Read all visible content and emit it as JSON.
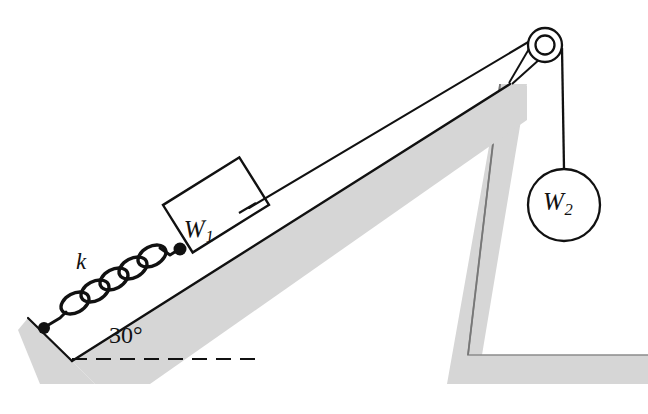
{
  "figure": {
    "type": "physics-free-body-diagram",
    "background_color": "#ffffff",
    "line_color": "#111111",
    "shadow_gray": "#d6d6d6",
    "support_gray": "#d6d6d6"
  },
  "labels": {
    "spring_constant": "k",
    "incline_angle": "30°",
    "block_weight": "W",
    "block_weight_subscript": "1",
    "hanging_weight": "W",
    "hanging_weight_subscript": "2"
  },
  "elements": {
    "incline_surface": "incline-surface",
    "incline_shadow": "incline-shadow-band",
    "left_wall": "incline-left-wall",
    "dashed_horizontal": "horizontal-reference-dashed-line",
    "spring": "coil-spring",
    "spring_coils": 5,
    "spring_anchor_lower": "spring-lower-anchor-dot",
    "spring_anchor_upper": "spring-upper-anchor-dot",
    "block": "block-w1",
    "cord": "cord-over-pulley",
    "pulley_outer": "pulley-wheel",
    "pulley_inner": "pulley-axle",
    "hanging_cord": "hanging-cord",
    "hanging_weight_circle": "hanging-weight-w2",
    "support_structure": "L-shaped-support-column"
  },
  "geometry": {
    "incline_angle_degrees": 30,
    "pulley_center": [
      545,
      45
    ],
    "pulley_outer_radius": 17,
    "pulley_inner_radius": 9,
    "weight_circle_center": [
      564,
      205
    ],
    "weight_circle_radius": 36,
    "incline_vertex": [
      72,
      361
    ],
    "dashed_line_y": 359,
    "dashed_line_x_range": [
      72,
      260
    ]
  }
}
